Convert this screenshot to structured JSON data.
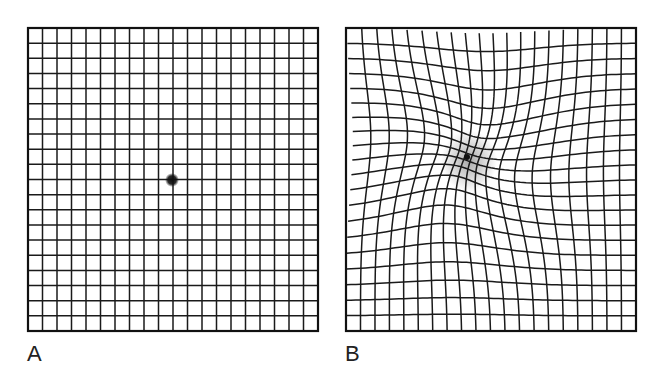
{
  "figure": {
    "panels": [
      {
        "id": "A",
        "label": "A",
        "description": "Normal Amsler grid",
        "grid": {
          "x": 28,
          "y": 28,
          "width": 290,
          "height": 303,
          "cols": 20,
          "rows": 20
        },
        "fixation_dot": {
          "x": 172,
          "y": 180,
          "radius": 5
        },
        "distortion": null
      },
      {
        "id": "B",
        "label": "B",
        "description": "Distorted Amsler grid (metamorphopsia)",
        "grid": {
          "x": 346,
          "y": 28,
          "width": 290,
          "height": 303,
          "cols": 20,
          "rows": 20
        },
        "fixation_dot": {
          "x": 467,
          "y": 157,
          "radius": 3
        },
        "distortion": {
          "center_x": 467,
          "center_y": 157,
          "strength": 0.55,
          "radius": 95,
          "shade_radius": 28
        }
      }
    ],
    "colors": {
      "line": "#1a1a1a",
      "border": "#111111",
      "dot": "#111111",
      "shade": "#9a9a9a",
      "background": "#ffffff"
    }
  }
}
